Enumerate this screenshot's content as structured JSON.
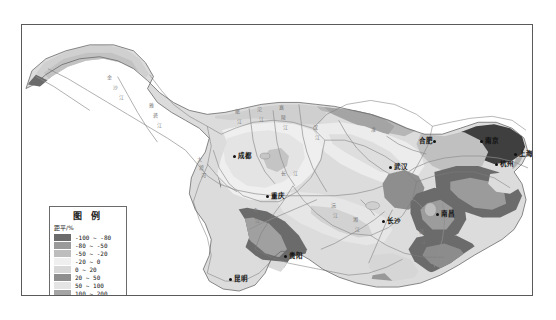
{
  "figure": {
    "kind": "choropleth-map",
    "region": "Yangtze River Basin",
    "frame": {
      "x": 21,
      "y": 24,
      "width": 512,
      "height": 272
    }
  },
  "legend": {
    "title": "图  例",
    "unit": "距平/%",
    "entries": [
      {
        "label": "-100 ~ -80",
        "color": "#6b6b6b"
      },
      {
        "label": "-80 ~ -50",
        "color": "#9a9a9a"
      },
      {
        "label": "-50 ~ -20",
        "color": "#bdbdbd"
      },
      {
        "label": "-20 ~ 0",
        "color": "#efefef"
      },
      {
        "label": "0 ~ 20",
        "color": "#d8d8d8"
      },
      {
        "label": "20 ~ 50",
        "color": "#8e8e8e"
      },
      {
        "label": "50 ~ 100",
        "color": "#e4e4e4"
      },
      {
        "label": "100 ~ 200",
        "color": "#a4a4a4"
      },
      {
        "label": "> 200",
        "color": "#3f3f3f"
      }
    ]
  },
  "cities": [
    {
      "name": "成都",
      "x": 232,
      "y": 152,
      "side": "left"
    },
    {
      "name": "重庆",
      "x": 265,
      "y": 192,
      "side": "left"
    },
    {
      "name": "武汉",
      "x": 388,
      "y": 163,
      "side": "left"
    },
    {
      "name": "合肥",
      "x": 434,
      "y": 137,
      "side": "right"
    },
    {
      "name": "南京",
      "x": 479,
      "y": 137,
      "side": "left"
    },
    {
      "name": "上海",
      "x": 513,
      "y": 150,
      "side": "left"
    },
    {
      "name": "杭州",
      "x": 494,
      "y": 160,
      "side": "left"
    },
    {
      "name": "南昌",
      "x": 435,
      "y": 210,
      "side": "left"
    },
    {
      "name": "长沙",
      "x": 381,
      "y": 217,
      "side": "left"
    },
    {
      "name": "贵阳",
      "x": 283,
      "y": 252,
      "side": "left"
    },
    {
      "name": "昆明",
      "x": 228,
      "y": 275,
      "side": "left"
    }
  ],
  "map_glyphs": [
    {
      "text": "金",
      "x": 106,
      "y": 72
    },
    {
      "text": "沙",
      "x": 112,
      "y": 82
    },
    {
      "text": "江",
      "x": 118,
      "y": 92
    },
    {
      "text": "雅",
      "x": 148,
      "y": 100
    },
    {
      "text": "砻",
      "x": 152,
      "y": 110
    },
    {
      "text": "江",
      "x": 156,
      "y": 120
    },
    {
      "text": "岷",
      "x": 234,
      "y": 106
    },
    {
      "text": "江",
      "x": 236,
      "y": 116
    },
    {
      "text": "沱",
      "x": 256,
      "y": 104
    },
    {
      "text": "江",
      "x": 258,
      "y": 114
    },
    {
      "text": "嘉",
      "x": 278,
      "y": 102
    },
    {
      "text": "陵",
      "x": 280,
      "y": 112
    },
    {
      "text": "江",
      "x": 282,
      "y": 122
    },
    {
      "text": "汉",
      "x": 312,
      "y": 122
    },
    {
      "text": "江",
      "x": 314,
      "y": 132
    },
    {
      "text": "长",
      "x": 280,
      "y": 168
    },
    {
      "text": "江",
      "x": 292,
      "y": 168
    },
    {
      "text": "乌",
      "x": 252,
      "y": 205
    },
    {
      "text": "江",
      "x": 254,
      "y": 215
    },
    {
      "text": "沅",
      "x": 330,
      "y": 200
    },
    {
      "text": "江",
      "x": 332,
      "y": 210
    },
    {
      "text": "湘",
      "x": 352,
      "y": 214
    },
    {
      "text": "江",
      "x": 354,
      "y": 224
    },
    {
      "text": "赣",
      "x": 418,
      "y": 226
    },
    {
      "text": "江",
      "x": 420,
      "y": 236
    },
    {
      "text": "淮",
      "x": 370,
      "y": 124
    },
    {
      "text": "大",
      "x": 196,
      "y": 154
    },
    {
      "text": "渡",
      "x": 198,
      "y": 162
    },
    {
      "text": "河",
      "x": 200,
      "y": 170
    }
  ],
  "colors": {
    "frame_border": "#5a5a5a",
    "map_outline": "#6a6a6a",
    "river": "#8a8a8a",
    "background": "#ffffff"
  }
}
